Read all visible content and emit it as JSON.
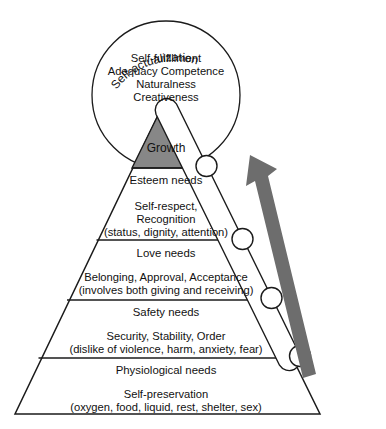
{
  "diagram": {
    "colors": {
      "growth_fill": "#878787",
      "arrow": "#6d6d6d",
      "line": "#1b1b1b",
      "background": "#ffffff"
    },
    "circle": {
      "curved_label": "Self-actualization",
      "lines": [
        "Self-fulfillment",
        "Adequacy Competence",
        "Naturalness",
        "Creativeness"
      ]
    },
    "growth_label": "Growth",
    "levels": [
      {
        "name": "esteem",
        "title": "Esteem needs",
        "details": [
          "Self-respect,",
          "Recognition",
          "(status, dignity, attention)"
        ]
      },
      {
        "name": "love",
        "title": "Love needs",
        "details": [
          "Belonging, Approval, Acceptance",
          "(involves both giving and receiving)"
        ]
      },
      {
        "name": "safety",
        "title": "Safety needs",
        "details": [
          "Security, Stability, Order",
          "(dislike of violence, harm, anxiety, fear)"
        ]
      },
      {
        "name": "physiological",
        "title": "Physiological needs",
        "details": [
          "Self-preservation",
          "(oxygen, food, liquid, rest, shelter, sex)"
        ]
      }
    ],
    "arrow": {
      "name": "upward-progression-arrow",
      "direction": "up-left"
    }
  }
}
